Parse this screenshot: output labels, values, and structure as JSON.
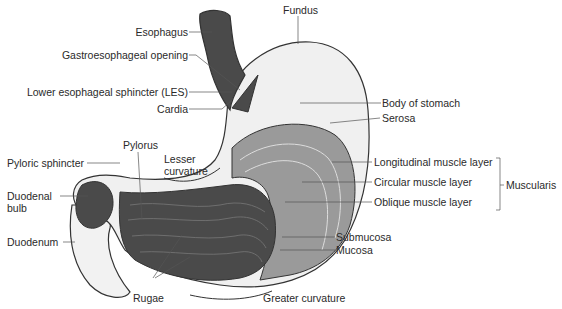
{
  "diagram": {
    "labels": {
      "esophagus": "Esophagus",
      "gastroesophageal_opening": "Gastroesophageal opening",
      "les": "Lower esophageal sphincter (LES)",
      "cardia": "Cardia",
      "fundus": "Fundus",
      "body": "Body of stomach",
      "serosa": "Serosa",
      "pylorus": "Pylorus",
      "pyloric_sphincter": "Pyloric sphincter",
      "lesser_curvature_1": "Lesser",
      "lesser_curvature_2": "curvature",
      "duodenal_bulb_1": "Duodenal",
      "duodenal_bulb_2": "bulb",
      "duodenum": "Duodenum",
      "longitudinal": "Longitudinal muscle layer",
      "circular": "Circular muscle layer",
      "oblique": "Oblique muscle layer",
      "muscularis": "Muscularis",
      "submucosa": "Submucosa",
      "mucosa": "Mucosa",
      "rugae": "Rugae",
      "greater_curvature": "Greater curvature"
    },
    "colors": {
      "outline": "#333333",
      "serosa_fill": "#f0f0f0",
      "muscle_fill": "#9a9a9a",
      "mucosa_fill": "#4a4a4a",
      "leader": "#555555"
    }
  }
}
